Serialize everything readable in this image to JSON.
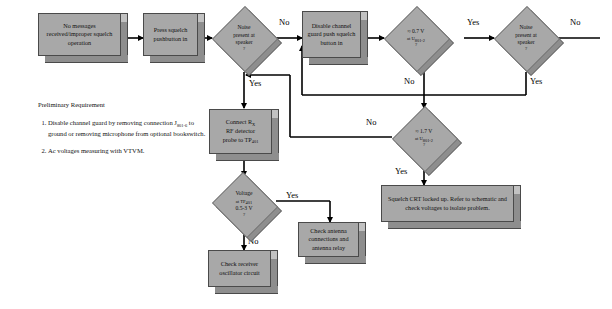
{
  "diagram": {
    "colors": {
      "node_fill": "#a8a8a8",
      "node_shadow": "#8e8e8e",
      "node_stroke": "#4a4a4a",
      "line": "#000000",
      "text": "#111111",
      "background": "#ffffff"
    }
  },
  "notes": {
    "heading": "Preliminary Requirement",
    "items": [
      "Disable channel guard by removing connection J801-6 to ground or removing microphone from optional bookswitch.",
      "Ac voltages measuring with VTVM."
    ]
  },
  "nodes": {
    "start": {
      "type": "process",
      "label": "No messages received/improper squelch operation"
    },
    "press_squelch": {
      "type": "process",
      "label": "Press squelch pushbutton in"
    },
    "noise_speaker_1": {
      "type": "decision",
      "line1": "Noise",
      "line2": "present at",
      "line3": "speaker",
      "line4": "?"
    },
    "disable_guard": {
      "type": "process",
      "label": "Disable channel guard push squelch button in"
    },
    "volt_0_7": {
      "type": "decision",
      "line1": "≈ 0.7 V",
      "line2": "at U801-2",
      "line3": "?"
    },
    "noise_speaker_2": {
      "type": "decision",
      "line1": "Noise",
      "line2": "present at",
      "line3": "speaker",
      "line4": "?"
    },
    "volt_1_7": {
      "type": "decision",
      "line1": "≈ 1.7 V",
      "line2": "at U801-2",
      "line3": "?"
    },
    "connect_rf": {
      "type": "process",
      "label": "Connect RX RF detector probe to TP401"
    },
    "voltage_tp401": {
      "type": "decision",
      "line1": "Voltage",
      "line2": "at TP401",
      "line3": "0.5-3 V",
      "line4": "?"
    },
    "squelch_crt": {
      "type": "process",
      "label": "Squelch CRT locked up. Refer to schematic and check voltages to isolate problem."
    },
    "check_antenna": {
      "type": "process",
      "label": "Check antenna connections and antenna relay"
    },
    "check_receiver": {
      "type": "process",
      "label": "Check receiver oscillator circuit"
    }
  },
  "edge_labels": {
    "no_1": "No",
    "yes_1": "Yes",
    "yes_2": "Yes",
    "no_2": "No",
    "no_3": "No",
    "yes_3": "Yes",
    "no_4": "No",
    "yes_4": "Yes",
    "yes_5": "Yes",
    "no_5": "No"
  }
}
